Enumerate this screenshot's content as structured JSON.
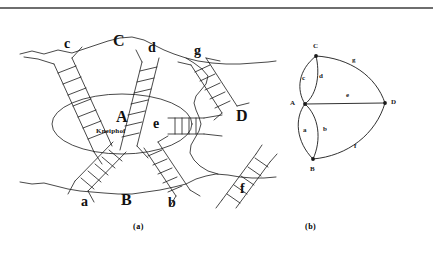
{
  "figure": {
    "caption_a": "(a)",
    "caption_b": "(b)"
  },
  "panel_a": {
    "title": "Map of Konigsberg with seven bridges",
    "island_label": "A",
    "island_name": "Kneiphof",
    "land_masses": [
      {
        "id": "A",
        "label": "A",
        "x": 104,
        "y": 107,
        "role": "island"
      },
      {
        "id": "B",
        "label": "B",
        "x": 122,
        "y": 196,
        "role": "south-bank"
      },
      {
        "id": "C",
        "label": "C",
        "x": 113,
        "y": 33,
        "role": "north-bank"
      },
      {
        "id": "D",
        "label": "D",
        "x": 236,
        "y": 110,
        "role": "east-bank"
      }
    ],
    "bridges": [
      {
        "id": "a",
        "label": "a",
        "x": 82,
        "y": 198,
        "connects": [
          "A",
          "B"
        ]
      },
      {
        "id": "b",
        "label": "b",
        "x": 169,
        "y": 199,
        "connects": [
          "A",
          "B"
        ]
      },
      {
        "id": "c",
        "label": "c",
        "x": 65,
        "y": 36,
        "connects": [
          "A",
          "C"
        ]
      },
      {
        "id": "d",
        "label": "d",
        "x": 149,
        "y": 41,
        "connects": [
          "A",
          "C"
        ]
      },
      {
        "id": "e",
        "label": "e",
        "x": 160,
        "y": 114,
        "connects": [
          "A",
          "D"
        ]
      },
      {
        "id": "f",
        "label": "f",
        "x": 241,
        "y": 186,
        "connects": [
          "B",
          "D"
        ]
      },
      {
        "id": "g",
        "label": "g",
        "x": 195,
        "y": 44,
        "connects": [
          "C",
          "D"
        ]
      }
    ]
  },
  "panel_b": {
    "title": "Multigraph of the Konigsberg bridges",
    "vertices": [
      {
        "id": "A",
        "label": "A",
        "x": 20,
        "y": 61
      },
      {
        "id": "B",
        "label": "B",
        "x": 42,
        "y": 122
      },
      {
        "id": "C",
        "label": "C",
        "x": 45,
        "y": 6
      },
      {
        "id": "D",
        "label": "D",
        "x": 117,
        "y": 61
      }
    ],
    "edges": [
      {
        "id": "c",
        "label": "c",
        "from": "A",
        "to": "C",
        "x": 37,
        "y": 33
      },
      {
        "id": "d",
        "label": "d",
        "from": "A",
        "to": "C",
        "x": 58,
        "y": 33
      },
      {
        "id": "g",
        "label": "g",
        "from": "C",
        "to": "D",
        "x": 84,
        "y": 16
      },
      {
        "id": "e",
        "label": "e",
        "from": "A",
        "to": "D",
        "x": 79,
        "y": 52
      },
      {
        "id": "a",
        "label": "a",
        "from": "A",
        "to": "B",
        "x": 36,
        "y": 89
      },
      {
        "id": "b",
        "label": "b",
        "from": "A",
        "to": "B",
        "x": 59,
        "y": 89
      },
      {
        "id": "f",
        "label": "f",
        "from": "B",
        "to": "D",
        "x": 86,
        "y": 106
      }
    ]
  },
  "colors": {
    "ink": "#111111",
    "rule": "#6e6e6e",
    "background": "#ffffff"
  }
}
